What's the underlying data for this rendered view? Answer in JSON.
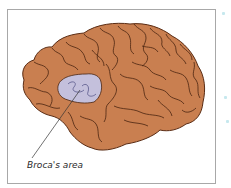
{
  "diagram": {
    "labels": [
      {
        "text": "Broca's area",
        "target": "brocas-area"
      }
    ]
  },
  "colors": {
    "brain_fill": "#c97f50",
    "gyri_lines": "#4a2410",
    "brocas_area_fill": "#c4c0dc",
    "frame_border": "#a8a8a8",
    "label_text": "#2a2a2a"
  }
}
